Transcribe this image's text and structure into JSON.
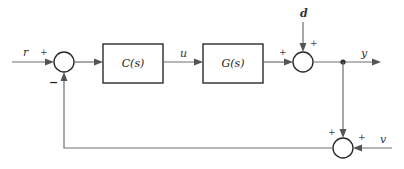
{
  "diagram": {
    "type": "feedback-control-block-diagram",
    "blocks": [
      {
        "id": "controller",
        "label": "C(s)"
      },
      {
        "id": "plant",
        "label": "G(s)"
      }
    ],
    "signals": {
      "reference": "r",
      "control": "u",
      "disturbance": "d",
      "output": "y",
      "noise": "v"
    },
    "summing_junctions": [
      {
        "id": "sum-error",
        "signs": {
          "r": "+",
          "feedback": "−"
        }
      },
      {
        "id": "sum-disturbance",
        "signs": {
          "plant": "+",
          "d": "+"
        }
      },
      {
        "id": "sum-noise",
        "signs": {
          "y": "+",
          "v": "+"
        }
      }
    ],
    "colors": {
      "line": "#6e6e6e",
      "block_border": "#2a2a2a",
      "background": "#ffffff"
    }
  }
}
